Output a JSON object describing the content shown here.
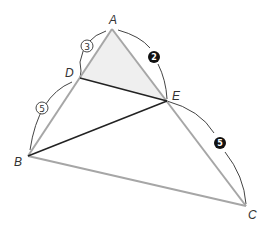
{
  "diagram": {
    "points": {
      "A": {
        "label": "A",
        "x": 112,
        "y": 29
      },
      "B": {
        "label": "B",
        "x": 28,
        "y": 156
      },
      "C": {
        "label": "C",
        "x": 246,
        "y": 206
      },
      "D": {
        "label": "D",
        "x": 80,
        "y": 78
      },
      "E": {
        "label": "E",
        "x": 167,
        "y": 101
      }
    },
    "shaded_region": "triangle ADE",
    "segments": {
      "gray": [
        "AB",
        "AC",
        "BC"
      ],
      "black": [
        "DE",
        "BE"
      ]
    },
    "ratio_marks": [
      {
        "text": "3",
        "style": "circled-open",
        "segment": "AD"
      },
      {
        "text": "5",
        "style": "circled-open",
        "segment": "DB"
      },
      {
        "text": "2",
        "style": "circled-filled",
        "segment": "AE"
      },
      {
        "text": "5",
        "style": "circled-filled",
        "segment": "EC"
      }
    ],
    "colors": {
      "gray_line": "#a6a6a6",
      "black_line": "#222222",
      "arc": "#444444",
      "shade": "#efefef"
    }
  }
}
